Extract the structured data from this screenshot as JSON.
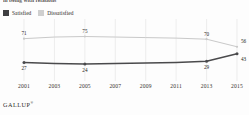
{
  "figure": {
    "title_truncated": "in being with relations",
    "source_label": "GALLUP",
    "source_mark": "®"
  },
  "legend": {
    "position": "top-left",
    "items": [
      {
        "label": "Satisfied",
        "color": "#3f3f41",
        "icon": "legend-swatch-icon"
      },
      {
        "label": "Dissatisfied",
        "color": "#cfcfcf",
        "icon": "legend-swatch-icon"
      }
    ]
  },
  "chart_data": {
    "type": "line",
    "title": "in being with relations",
    "xlabel": "",
    "ylabel": "",
    "ylim": [
      0,
      100
    ],
    "grid": "vertical",
    "legend_position": "top-left",
    "x": [
      2001,
      2003,
      2005,
      2007,
      2009,
      2011,
      2013,
      2015
    ],
    "categories": [
      "2001",
      "2003",
      "2005",
      "2007",
      "2009",
      "2011",
      "2013",
      "2015"
    ],
    "series": [
      {
        "name": "Dissatisfied",
        "color": "#c9c9c9",
        "values": [
          71,
          74,
          75,
          74,
          73,
          72,
          70,
          56
        ],
        "point_labels": [
          {
            "x": 2001,
            "value": 71,
            "text": "71"
          },
          {
            "x": 2005,
            "value": 75,
            "text": "75"
          },
          {
            "x": 2013,
            "value": 70,
            "text": "70"
          },
          {
            "x": 2015,
            "value": 56,
            "text": "56"
          }
        ]
      },
      {
        "name": "Satisfied",
        "color": "#4a4a4c",
        "values": [
          27,
          25,
          24,
          25,
          26,
          27,
          29,
          43
        ],
        "point_labels": [
          {
            "x": 2001,
            "value": 27,
            "text": "27"
          },
          {
            "x": 2005,
            "value": 24,
            "text": "24"
          },
          {
            "x": 2013,
            "value": 29,
            "text": "29"
          },
          {
            "x": 2015,
            "value": 43,
            "text": "43"
          }
        ]
      }
    ],
    "markers_at": [
      2001,
      2005,
      2013,
      2015
    ]
  },
  "xaxis": {
    "ticks": [
      "2001",
      "2003",
      "2005",
      "2007",
      "2009",
      "2011",
      "2013",
      "2015"
    ]
  }
}
